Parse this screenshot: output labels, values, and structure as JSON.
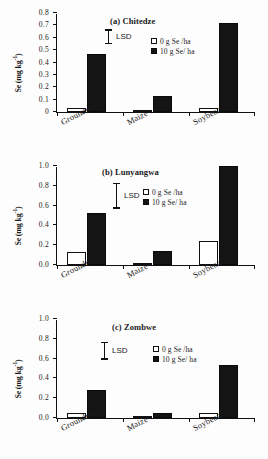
{
  "figure": {
    "ylabel": "Se (mg kg",
    "ylabel_sup": "-1",
    "ylabel_close": ")",
    "lsd_label": "LSD",
    "categories": [
      "Groundnuts",
      "Maize",
      "Soybean"
    ],
    "legend": [
      {
        "key": "open",
        "label": "0 g Se /ha"
      },
      {
        "key": "filled",
        "label": "10 g Se/ ha"
      }
    ]
  },
  "chart_data": [
    {
      "type": "bar",
      "title": "(a) Chitedze",
      "categories": [
        "Groundnuts",
        "Maize",
        "Soybean"
      ],
      "series": [
        {
          "name": "0 g Se /ha",
          "values": [
            0.035,
            0.015,
            0.035
          ]
        },
        {
          "name": "10 g Se/ ha",
          "values": [
            0.465,
            0.13,
            0.72
          ]
        }
      ],
      "xlabel": "",
      "ylabel": "Se (mg kg-1)",
      "ylim": [
        0,
        0.8
      ],
      "yticks": [
        "0",
        "0.1",
        "0.2",
        "0.3",
        "0.4",
        "0.5",
        "0.6",
        "0.7",
        "0.8"
      ],
      "grid": false,
      "legend_position": "top-right",
      "annotations": [
        {
          "name": "LSD",
          "type": "error-bar",
          "from": 0.555,
          "to": 0.675
        }
      ]
    },
    {
      "type": "bar",
      "title": "(b) Lunyangwa",
      "categories": [
        "Groundnuts",
        "Maize",
        "Soybean"
      ],
      "series": [
        {
          "name": "0 g Se /ha",
          "values": [
            0.13,
            0.005,
            0.245
          ]
        },
        {
          "name": "10 g Se/ ha",
          "values": [
            0.53,
            0.14,
            1.0
          ]
        }
      ],
      "xlabel": "",
      "ylabel": "Se (mg kg-1)",
      "ylim": [
        0,
        1.0
      ],
      "yticks": [
        "0.0",
        "0.2",
        "0.4",
        "0.6",
        "0.8",
        "1.0"
      ],
      "grid": false,
      "legend_position": "top-right",
      "annotations": [
        {
          "name": "LSD",
          "type": "error-bar",
          "from": 0.58,
          "to": 0.84
        }
      ]
    },
    {
      "type": "bar",
      "title": "(c) Zombwe",
      "categories": [
        "Groundnuts",
        "Maize",
        "Soybean"
      ],
      "series": [
        {
          "name": "0 g Se /ha",
          "values": [
            0.055,
            0.018,
            0.055
          ]
        },
        {
          "name": "10 g Se/ ha",
          "values": [
            0.285,
            0.052,
            0.54
          ]
        }
      ],
      "xlabel": "",
      "ylabel": "Se (mg kg-1)",
      "ylim": [
        0,
        1.0
      ],
      "yticks": [
        "0.0",
        "0.2",
        "0.4",
        "0.6",
        "0.8",
        "1.0"
      ],
      "grid": false,
      "legend_position": "top-right",
      "annotations": [
        {
          "name": "LSD",
          "type": "error-bar",
          "from": 0.6,
          "to": 0.78
        }
      ]
    }
  ]
}
